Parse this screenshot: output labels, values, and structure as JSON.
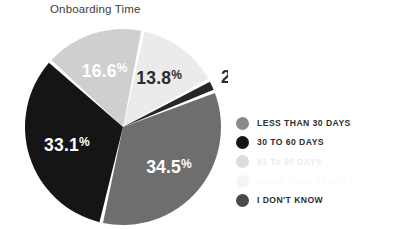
{
  "title": "Onboarding Time",
  "colors": {
    "less_than_30": "#8a8a8a",
    "30_to_60": "#151515",
    "61_to_90": "#dcdcdc",
    "more_than_91": "#f2f2f2",
    "dont_know": "#4a4a4a",
    "slice_16_6": "#cfcfcf",
    "slice_13_8": "#ebebeb",
    "slice_2": "#262626",
    "slice_34_5": "#6e6e6e",
    "slice_33_1": "#151515",
    "title_text": "#3c3c3c",
    "legend_text": "#2e2e2e"
  },
  "legend": {
    "items": [
      {
        "label": "LESS THAN 30 DAYS",
        "color": "#8a8a8a",
        "state": "normal"
      },
      {
        "label": "30 TO 60 DAYS",
        "color": "#151515",
        "state": "normal"
      },
      {
        "label": "61 To 90 DAYS",
        "color": "#dcdcdc",
        "state": "faded"
      },
      {
        "label": "MORE THAN 91 DAYS",
        "color": "#f4f4f4",
        "state": "faded-2"
      },
      {
        "label": "I DON'T KNOW",
        "color": "#4a4a4a",
        "state": "normal"
      }
    ]
  },
  "chart_data": {
    "type": "pie",
    "title": "Onboarding Time",
    "xlabel": "",
    "ylabel": "",
    "legend_position": "right",
    "grid": false,
    "labels": [
      "LESS THAN 30 DAYS",
      "30 TO 60 DAYS",
      "61 To 90 DAYS",
      "MORE THAN 91 DAYS",
      "I DON'T KNOW"
    ],
    "slices": [
      {
        "name": "61 To 90 DAYS",
        "value": 16.6,
        "display": "16.6",
        "pct_sign": "%",
        "color": "#cfcfcf",
        "label_color": "#ffffff"
      },
      {
        "name": "MORE THAN 91 DAYS",
        "value": 13.8,
        "display": "13.8",
        "pct_sign": "%",
        "color": "#ebebeb",
        "label_color": "#2b2b2b"
      },
      {
        "name": "I DON'T KNOW",
        "value": 2.0,
        "display": "2",
        "pct_sign": "%",
        "color": "#262626",
        "label_color": "#2b2b2b"
      },
      {
        "name": "LESS THAN 30 DAYS",
        "value": 34.5,
        "display": "34.5",
        "pct_sign": "%",
        "color": "#6e6e6e",
        "label_color": "#ffffff"
      },
      {
        "name": "30 TO 60 DAYS",
        "value": 33.1,
        "display": "33.1",
        "pct_sign": "%",
        "color": "#151515",
        "label_color": "#ffffff"
      }
    ],
    "values": [
      34.5,
      33.1,
      16.6,
      13.8,
      2.0
    ],
    "value_labels": [
      "34.5%",
      "33.1%",
      "16.6%",
      "13.8%",
      "2%"
    ],
    "total": 100.0
  }
}
